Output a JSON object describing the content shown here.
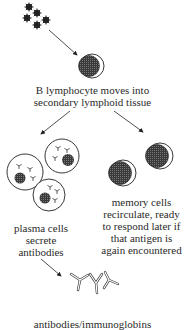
{
  "diagram": {
    "nodes": {
      "antigen": {
        "icon": "antigen-cluster-icon"
      },
      "b_lymphocyte": {
        "icon": "b-lymphocyte-icon",
        "label": [
          "B lymphocyte moves into",
          "secondary lymphoid tissue"
        ]
      },
      "plasma_cells": {
        "icon": "plasma-cells-icon",
        "label": [
          "plasma cells",
          "secrete",
          "antibodies"
        ]
      },
      "memory_cells": {
        "icon": "memory-cells-icon",
        "label": [
          "memory cells",
          "recirculate, ready",
          "to respond later if",
          "that antigen is",
          "again encountered"
        ]
      },
      "antibodies": {
        "icon": "antibodies-icon",
        "label": [
          "antibodies/immunoglobins"
        ]
      }
    },
    "edges": [
      {
        "from": "antigen",
        "to": "b_lymphocyte"
      },
      {
        "from": "b_lymphocyte",
        "to": "plasma_cells"
      },
      {
        "from": "b_lymphocyte",
        "to": "memory_cells"
      },
      {
        "from": "plasma_cells",
        "to": "antibodies"
      }
    ],
    "colors": {
      "ink": "#222222",
      "fill": "#555555",
      "background": "#ffffff"
    }
  }
}
